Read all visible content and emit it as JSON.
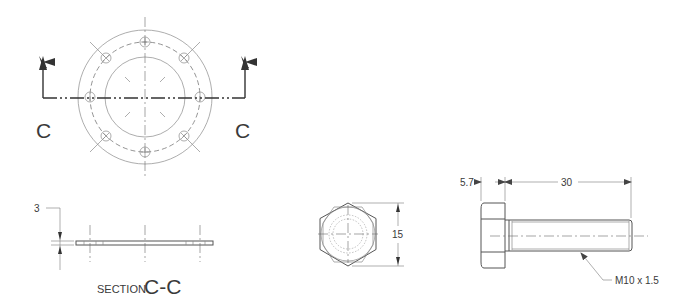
{
  "drawing": {
    "section_letter_left": "C",
    "section_letter_right": "C",
    "section_title_prefix": "SECTION",
    "section_title_id": "C-C",
    "thickness_dim": "3",
    "hex_across_flats_dim": "15",
    "head_height_dim": "5.7",
    "shank_length_dim": "30",
    "thread_callout": "M10 x 1.5"
  },
  "flange": {
    "bolt_hole_count": 8
  },
  "colors": {
    "line": "#555555",
    "text": "#3a3a3a",
    "background": "#ffffff"
  }
}
